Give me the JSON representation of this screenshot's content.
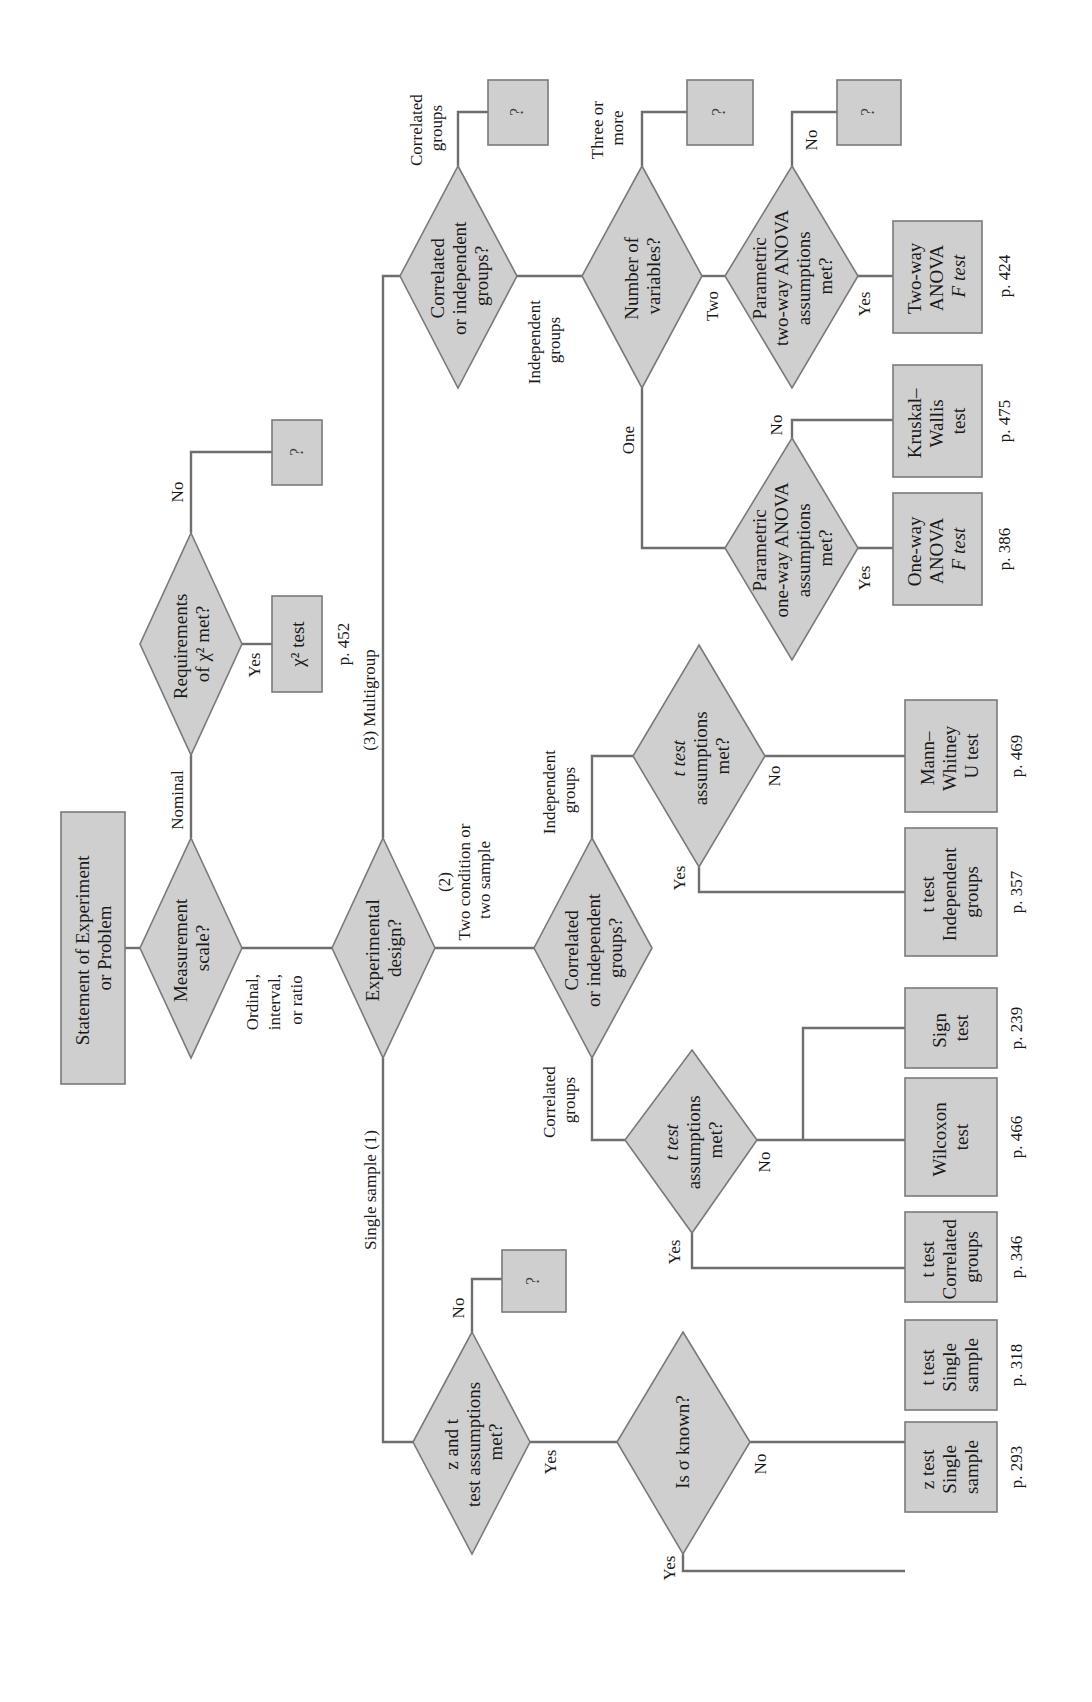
{
  "diagram": {
    "orientation": "rotated-90-ccw",
    "colors": {
      "node_fill": "#cfcfcf",
      "node_stroke": "#7a7a7a",
      "edge": "#6e6e6e",
      "text": "#1a1a1a"
    },
    "nodes": {
      "start": {
        "lines": [
          "Statement of Experiment",
          "or Problem"
        ]
      },
      "measurement": {
        "lines": [
          "Measurement",
          "scale?"
        ]
      },
      "chi_req": {
        "lines": [
          "Requirements",
          "of χ² met?"
        ]
      },
      "chi_test": {
        "lines": [
          "χ² test"
        ],
        "page": "p. 452"
      },
      "chi_unknown": {
        "lines": [
          "?"
        ]
      },
      "design": {
        "lines": [
          "Experimental",
          "design?"
        ]
      },
      "multi_corr": {
        "lines": [
          "Correlated",
          "or independent",
          "groups?"
        ]
      },
      "multi_corr_unknown": {
        "lines": [
          "?"
        ]
      },
      "num_vars": {
        "lines": [
          "Number of",
          "variables?"
        ]
      },
      "num_vars_unknown": {
        "lines": [
          "?"
        ]
      },
      "twoway_q": {
        "lines": [
          "Parametric",
          "two-way ANOVA",
          "assumptions",
          "met?"
        ]
      },
      "twoway_unknown": {
        "lines": [
          "?"
        ]
      },
      "twoway_test": {
        "lines": [
          "Two-way",
          "ANOVA",
          "F test"
        ],
        "page": "p. 424"
      },
      "oneway_q": {
        "lines": [
          "Parametric",
          "one-way ANOVA",
          "assumptions",
          "met?"
        ]
      },
      "oneway_test": {
        "lines": [
          "One-way",
          "ANOVA",
          "F test"
        ],
        "page": "p. 386"
      },
      "kruskal": {
        "lines": [
          "Kruskal–",
          "Wallis",
          "test"
        ],
        "page": "p. 475"
      },
      "two_corr": {
        "lines": [
          "Correlated",
          "or independent",
          "groups?"
        ]
      },
      "ind_t_q": {
        "lines": [
          "t test",
          "assumptions",
          "met?"
        ]
      },
      "ind_t_test": {
        "lines": [
          "t test",
          "Independent",
          "groups"
        ],
        "page": "p. 357"
      },
      "mann": {
        "lines": [
          "Mann–",
          "Whitney",
          "U test"
        ],
        "page": "p. 469"
      },
      "corr_t_q": {
        "lines": [
          "t test",
          "assumptions",
          "met?"
        ]
      },
      "corr_t_test": {
        "lines": [
          "t test",
          "Correlated",
          "groups"
        ],
        "page": "p. 346"
      },
      "wilcoxon": {
        "lines": [
          "Wilcoxon",
          "test"
        ],
        "page": "p. 466"
      },
      "sign": {
        "lines": [
          "Sign",
          "test"
        ],
        "page": "p. 239"
      },
      "zt_q": {
        "lines": [
          "z and t",
          "test assumptions",
          "met?"
        ]
      },
      "zt_unknown": {
        "lines": [
          "?"
        ]
      },
      "sigma_q": {
        "lines": [
          "Is σ known?"
        ]
      },
      "t_single": {
        "lines": [
          "t test",
          "Single",
          "sample"
        ],
        "page": "p. 318"
      },
      "z_single": {
        "lines": [
          "z test",
          "Single",
          "sample"
        ],
        "page": "p. 293"
      }
    },
    "edge_labels": {
      "nominal": "Nominal",
      "ordinal": [
        "Ordinal,",
        "interval,",
        "or ratio"
      ],
      "chi_yes": "Yes",
      "chi_no": "No",
      "multigroup": "(3) Multigroup",
      "two_condition": [
        "(2)",
        "Two condition or",
        "two sample"
      ],
      "single_sample": "Single sample (1)",
      "multi_correlated": [
        "Correlated",
        "groups"
      ],
      "multi_independent": [
        "Independent",
        "groups"
      ],
      "three_or_more": [
        "Three or",
        "more"
      ],
      "one": "One",
      "two": "Two",
      "twoway_yes": "Yes",
      "twoway_no": "No",
      "oneway_yes": "Yes",
      "oneway_no": "No",
      "two_independent": [
        "Independent",
        "groups"
      ],
      "two_correlated": [
        "Correlated",
        "groups"
      ],
      "ind_yes": "Yes",
      "ind_no": "No",
      "corr_yes": "Yes",
      "corr_no": "No",
      "zt_yes": "Yes",
      "zt_no": "No",
      "sigma_yes": "Yes",
      "sigma_no": "No"
    }
  }
}
